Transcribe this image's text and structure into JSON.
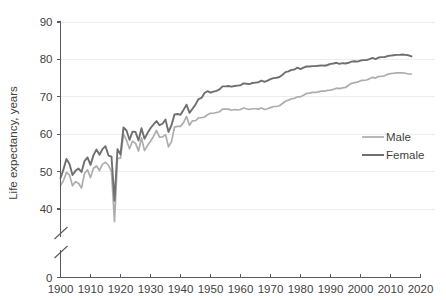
{
  "chart_data": {
    "type": "line",
    "title": "",
    "subtitle": "",
    "xlabel": "",
    "ylabel": "Life expectancy, years",
    "xlim": [
      1900,
      2020
    ],
    "ylim": [
      36,
      90
    ],
    "y_axis_break": true,
    "y_axis_break_note": "axis broken between 0 and 40",
    "grid": true,
    "grid_axis": "y",
    "legend_position": "right-middle",
    "x_ticks": [
      1900,
      1910,
      1920,
      1930,
      1940,
      1950,
      1960,
      1970,
      1980,
      1990,
      2000,
      2010,
      2020
    ],
    "x_tick_labels": [
      "1900",
      "1910",
      "1920",
      "1930",
      "1940",
      "1950",
      "1960",
      "1970",
      "1980",
      "1990",
      "2000",
      "2010",
      "2020"
    ],
    "y_ticks": [
      0,
      40,
      50,
      60,
      70,
      80,
      90
    ],
    "y_tick_labels": [
      "0",
      "40",
      "50",
      "60",
      "70",
      "80",
      "90"
    ],
    "colors": {
      "male": "#adadad",
      "female": "#6f6f6f",
      "gridline": "#ededed",
      "axis": "#5a5a5a",
      "text": "#3f3f3f",
      "background": "#ffffff"
    },
    "x": [
      1900,
      1901,
      1902,
      1903,
      1904,
      1905,
      1906,
      1907,
      1908,
      1909,
      1910,
      1911,
      1912,
      1913,
      1914,
      1915,
      1916,
      1917,
      1918,
      1919,
      1920,
      1921,
      1922,
      1923,
      1924,
      1925,
      1926,
      1927,
      1928,
      1929,
      1930,
      1931,
      1932,
      1933,
      1934,
      1935,
      1936,
      1937,
      1938,
      1939,
      1940,
      1941,
      1942,
      1943,
      1944,
      1945,
      1946,
      1947,
      1948,
      1949,
      1950,
      1951,
      1952,
      1953,
      1954,
      1955,
      1956,
      1957,
      1958,
      1959,
      1960,
      1961,
      1962,
      1963,
      1964,
      1965,
      1966,
      1967,
      1968,
      1969,
      1970,
      1971,
      1972,
      1973,
      1974,
      1975,
      1976,
      1977,
      1978,
      1979,
      1980,
      1981,
      1982,
      1983,
      1984,
      1985,
      1986,
      1987,
      1988,
      1989,
      1990,
      1991,
      1992,
      1993,
      1994,
      1995,
      1996,
      1997,
      1998,
      1999,
      2000,
      2001,
      2002,
      2003,
      2004,
      2005,
      2006,
      2007,
      2008,
      2009,
      2010,
      2011,
      2012,
      2013,
      2014,
      2015,
      2016,
      2017
    ],
    "series": [
      {
        "name": "Male",
        "color": "#adadad",
        "values": [
          46.3,
          47.6,
          49.8,
          49.1,
          46.2,
          47.3,
          46.9,
          45.6,
          49.5,
          50.5,
          48.4,
          50.9,
          51.5,
          50.3,
          52.0,
          52.5,
          51.7,
          50.0,
          36.6,
          53.5,
          53.6,
          60.0,
          58.4,
          56.1,
          58.1,
          57.6,
          55.5,
          59.0,
          55.6,
          57.0,
          58.1,
          59.4,
          61.0,
          59.2,
          59.3,
          59.9,
          56.6,
          58.0,
          61.9,
          62.1,
          62.1,
          63.1,
          64.7,
          62.4,
          63.6,
          63.6,
          64.4,
          64.4,
          64.6,
          65.2,
          65.6,
          65.6,
          65.8,
          66.0,
          66.7,
          66.7,
          66.7,
          66.4,
          66.6,
          66.5,
          66.6,
          67.0,
          66.8,
          66.6,
          66.8,
          66.8,
          66.7,
          67.0,
          66.6,
          66.8,
          67.1,
          67.4,
          67.4,
          67.6,
          68.2,
          68.8,
          69.1,
          69.5,
          69.6,
          70.0,
          70.0,
          70.4,
          70.9,
          71.0,
          71.2,
          71.2,
          71.3,
          71.5,
          71.5,
          71.7,
          71.8,
          72.0,
          72.3,
          72.2,
          72.4,
          72.5,
          73.1,
          73.6,
          73.8,
          73.9,
          74.3,
          74.4,
          74.5,
          74.8,
          75.2,
          75.0,
          75.4,
          75.5,
          75.6,
          76.0,
          76.2,
          76.3,
          76.4,
          76.4,
          76.4,
          76.3,
          76.1,
          76.1
        ]
      },
      {
        "name": "Female",
        "color": "#6f6f6f",
        "values": [
          48.3,
          50.6,
          53.4,
          52.0,
          49.1,
          50.2,
          50.8,
          49.9,
          52.8,
          53.8,
          51.8,
          54.4,
          55.9,
          54.5,
          56.0,
          56.8,
          54.3,
          54.0,
          42.2,
          56.0,
          54.6,
          61.8,
          61.0,
          58.5,
          60.7,
          60.6,
          58.3,
          61.6,
          58.8,
          60.3,
          61.6,
          62.6,
          63.5,
          62.4,
          62.8,
          63.9,
          60.6,
          62.4,
          65.3,
          65.4,
          65.2,
          66.5,
          67.9,
          65.7,
          66.8,
          67.9,
          69.4,
          69.7,
          71.0,
          71.5,
          71.1,
          71.4,
          71.6,
          72.0,
          72.8,
          72.8,
          72.9,
          72.7,
          72.9,
          73.0,
          73.1,
          73.6,
          73.5,
          73.4,
          73.7,
          73.8,
          73.9,
          74.3,
          74.0,
          74.3,
          74.7,
          75.0,
          75.1,
          75.3,
          75.9,
          76.6,
          76.8,
          77.2,
          77.3,
          77.8,
          77.4,
          77.8,
          78.1,
          78.1,
          78.2,
          78.2,
          78.3,
          78.4,
          78.3,
          78.5,
          78.8,
          78.9,
          79.1,
          78.8,
          79.0,
          78.9,
          79.1,
          79.4,
          79.5,
          79.4,
          79.7,
          79.8,
          79.8,
          80.1,
          80.4,
          80.1,
          80.5,
          80.6,
          80.6,
          80.9,
          81.0,
          81.1,
          81.2,
          81.2,
          81.3,
          81.2,
          81.1,
          80.8
        ]
      }
    ]
  },
  "legend": {
    "items": [
      {
        "label": "Male",
        "color": "#adadad"
      },
      {
        "label": "Female",
        "color": "#6f6f6f"
      }
    ]
  },
  "axes": {
    "y_title": "Life expectancy, years"
  }
}
